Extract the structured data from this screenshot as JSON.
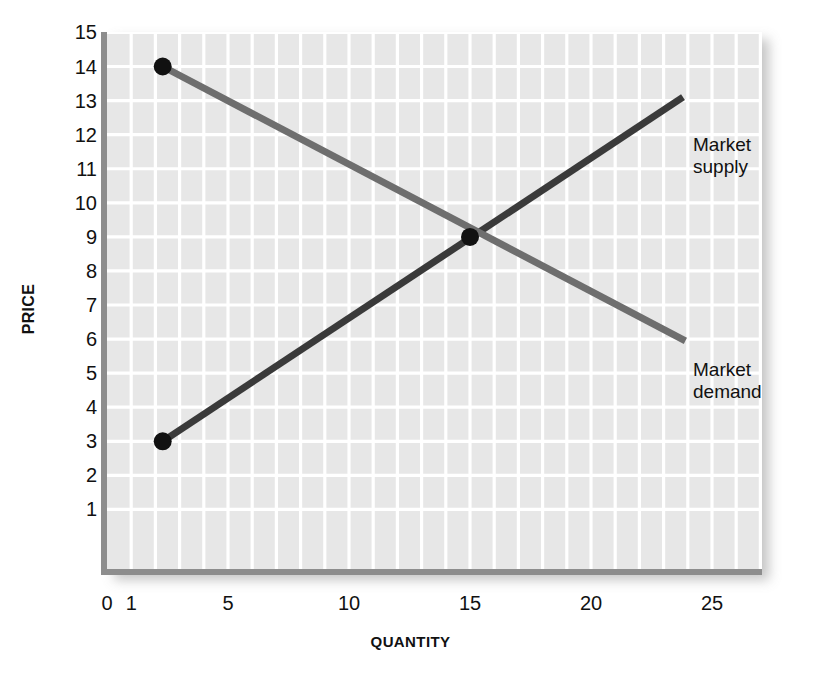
{
  "chart_data": {
    "type": "line",
    "title": "",
    "xlabel": "QUANTITY",
    "ylabel": "PRICE",
    "xlim": [
      0,
      27
    ],
    "ylim": [
      0,
      15.8
    ],
    "grid": true,
    "grid_minor_x_step": 1,
    "grid_major_y_step": 1,
    "legend_position": "inline-right",
    "xticks": [
      {
        "value": 0,
        "label": "0"
      },
      {
        "value": 1,
        "label": "1"
      },
      {
        "value": 5,
        "label": "5"
      },
      {
        "value": 10,
        "label": "10"
      },
      {
        "value": 15,
        "label": "15"
      },
      {
        "value": 20,
        "label": "20"
      },
      {
        "value": 25,
        "label": "25"
      }
    ],
    "yticks": [
      {
        "value": 15,
        "label": "15"
      },
      {
        "value": 14,
        "label": "14"
      },
      {
        "value": 13,
        "label": "13"
      },
      {
        "value": 12,
        "label": "12"
      },
      {
        "value": 11,
        "label": "11"
      },
      {
        "value": 10,
        "label": "10"
      },
      {
        "value": 9,
        "label": "9"
      },
      {
        "value": 8,
        "label": "8"
      },
      {
        "value": 7,
        "label": "7"
      },
      {
        "value": 6,
        "label": "6"
      },
      {
        "value": 5,
        "label": "5"
      },
      {
        "value": 4,
        "label": "4"
      },
      {
        "value": 3,
        "label": "3"
      },
      {
        "value": 2,
        "label": "2"
      },
      {
        "value": 1,
        "label": "1"
      }
    ],
    "series": [
      {
        "name": "Market supply",
        "label": "Market supply",
        "color": "#3a3a3a",
        "width": 7,
        "points": [
          {
            "x": 2.3,
            "y": 3
          },
          {
            "x": 23.8,
            "y": 13.1
          }
        ]
      },
      {
        "name": "Market demand",
        "label": "Market demand",
        "color": "#6e6e6e",
        "width": 7,
        "points": [
          {
            "x": 2.3,
            "y": 14
          },
          {
            "x": 23.9,
            "y": 5.95
          }
        ]
      }
    ],
    "markers": [
      {
        "name": "demand-intercept",
        "x": 2.3,
        "y": 14,
        "color": "#111111",
        "r": 9
      },
      {
        "name": "supply-intercept",
        "x": 2.3,
        "y": 3,
        "color": "#111111",
        "r": 9
      },
      {
        "name": "equilibrium",
        "x": 15,
        "y": 9,
        "color": "#111111",
        "r": 9
      }
    ],
    "annotations": [
      {
        "name": "supply-curve-label",
        "text": "Market\nsupply"
      },
      {
        "name": "demand-curve-label",
        "text": "Market\ndemand"
      }
    ],
    "plot_background": "#e7e7e7",
    "gridline_color": "#ffffff",
    "axis_color": "#8d8d8d"
  }
}
